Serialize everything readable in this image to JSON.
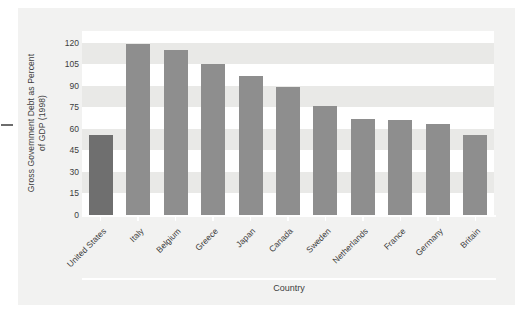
{
  "chart_data": {
    "type": "bar",
    "title": "",
    "xlabel": "Country",
    "ylabel": "Gross Government Debt as Percent of GDP (1998)",
    "ylabel_line1": "Gross Government Debt as Percent",
    "ylabel_line2": "of GDP (1998)",
    "categories": [
      "United States",
      "Italy",
      "Belgium",
      "Greece",
      "Japan",
      "Canada",
      "Sweden",
      "Netherlands",
      "France",
      "Germany",
      "Britain"
    ],
    "values": [
      56,
      119,
      115,
      105,
      97,
      89,
      76,
      67,
      66,
      63,
      56
    ],
    "ylim": [
      0,
      128
    ],
    "yticks": [
      0,
      15,
      30,
      45,
      60,
      75,
      90,
      105,
      120
    ],
    "ytick_labels": [
      "0",
      "15",
      "30",
      "45",
      "60",
      "75",
      "90",
      "105",
      "120"
    ],
    "grid": "horizontal-banding",
    "legend": "none",
    "highlight_index": 0,
    "colors": {
      "bar": "#8e8e8e",
      "bar_highlight": "#6f6f6f",
      "panel_background": "#f2f2f1",
      "band_light": "#ffffff",
      "band_dark": "#e9e9e7",
      "text": "#3d3d3d",
      "axis_line": "#ffffff"
    }
  }
}
